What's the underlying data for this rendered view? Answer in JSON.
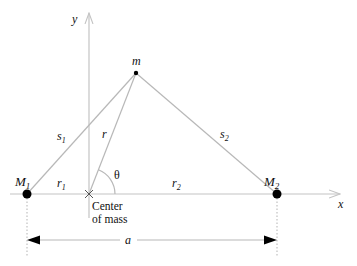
{
  "figure": {
    "colors": {
      "line": "#b8b8b8",
      "axis": "#c4c4c4",
      "mass": "#000000",
      "text": "#111111"
    }
  },
  "axes": {
    "x_label": "x",
    "y_label": "y"
  },
  "points": {
    "M1": {
      "label": "M",
      "subscript": "1"
    },
    "M2": {
      "label": "M",
      "subscript": "2"
    },
    "m": {
      "label": "m"
    },
    "center": {
      "line1": "Center",
      "line2": "of mass"
    }
  },
  "segments": {
    "s1": {
      "label": "s",
      "subscript": "1"
    },
    "s2": {
      "label": "s",
      "subscript": "2"
    },
    "r": {
      "label": "r"
    },
    "r1": {
      "label": "r",
      "subscript": "1"
    },
    "r2": {
      "label": "r",
      "subscript": "2"
    }
  },
  "angle": {
    "label": "θ"
  },
  "dimension": {
    "label": "a"
  }
}
